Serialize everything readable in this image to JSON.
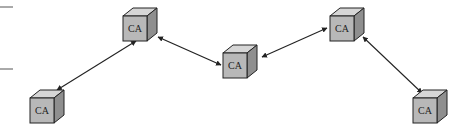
{
  "diagram": {
    "type": "network",
    "nodes": [
      {
        "id": "n1",
        "label": "CA",
        "x": 30,
        "y": 98
      },
      {
        "id": "n2",
        "label": "CA",
        "x": 123,
        "y": 14
      },
      {
        "id": "n3",
        "label": "CA",
        "x": 223,
        "y": 52
      },
      {
        "id": "n4",
        "label": "CA",
        "x": 330,
        "y": 14
      },
      {
        "id": "n5",
        "label": "CA",
        "x": 413,
        "y": 98
      }
    ],
    "edges": [
      {
        "from": "n1",
        "to": "n2",
        "direction": "bidirectional"
      },
      {
        "from": "n2",
        "to": "n3",
        "direction": "bidirectional"
      },
      {
        "from": "n3",
        "to": "n4",
        "direction": "bidirectional"
      },
      {
        "from": "n4",
        "to": "n5",
        "direction": "bidirectional"
      }
    ],
    "colors": {
      "front": "#b8b8b8",
      "top": "#d6d6d6",
      "side": "#8f8f8f",
      "stroke": "#222222"
    }
  }
}
